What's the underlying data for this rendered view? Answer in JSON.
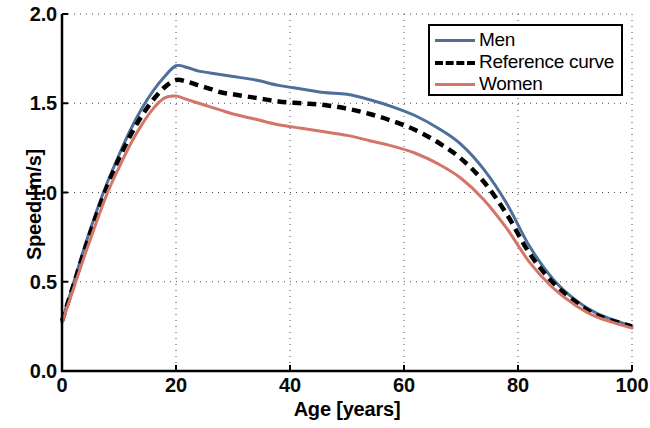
{
  "chart_data": {
    "type": "line",
    "title": "",
    "xlabel": "Age [years]",
    "ylabel": "Speed [m/s]",
    "xlim": [
      0,
      100
    ],
    "ylim": [
      0,
      2.0
    ],
    "xticks": [
      "0",
      "20",
      "40",
      "60",
      "80",
      "100"
    ],
    "xtick_values": [
      0,
      20,
      40,
      60,
      80,
      100
    ],
    "yticks": [
      "0.0",
      "0.5",
      "1.0",
      "1.5",
      "2.0"
    ],
    "ytick_values": [
      0.0,
      0.5,
      1.0,
      1.5,
      2.0
    ],
    "grid": true,
    "grid_style": "dotted",
    "legend_position": "top-right",
    "x": [
      0,
      2,
      4,
      6,
      8,
      10,
      12,
      14,
      16,
      18,
      20,
      22,
      24,
      26,
      28,
      30,
      34,
      38,
      42,
      46,
      50,
      54,
      58,
      62,
      66,
      70,
      74,
      78,
      82,
      86,
      90,
      94,
      100
    ],
    "series": [
      {
        "name": "Men",
        "color": "#4d6f9a",
        "style": "solid",
        "values": [
          0.28,
          0.49,
          0.7,
          0.89,
          1.06,
          1.21,
          1.35,
          1.47,
          1.57,
          1.65,
          1.71,
          1.7,
          1.68,
          1.67,
          1.66,
          1.65,
          1.63,
          1.6,
          1.58,
          1.56,
          1.55,
          1.52,
          1.48,
          1.43,
          1.36,
          1.27,
          1.13,
          0.94,
          0.7,
          0.52,
          0.4,
          0.32,
          0.25
        ]
      },
      {
        "name": "Reference curve",
        "color": "#000000",
        "style": "dashed",
        "values": [
          0.28,
          0.48,
          0.68,
          0.87,
          1.04,
          1.19,
          1.32,
          1.43,
          1.52,
          1.59,
          1.63,
          1.62,
          1.6,
          1.58,
          1.56,
          1.55,
          1.53,
          1.51,
          1.5,
          1.49,
          1.47,
          1.44,
          1.4,
          1.35,
          1.28,
          1.19,
          1.06,
          0.88,
          0.66,
          0.5,
          0.39,
          0.31,
          0.25
        ]
      },
      {
        "name": "Women",
        "color": "#d4756a",
        "style": "solid",
        "values": [
          0.27,
          0.46,
          0.65,
          0.83,
          1.0,
          1.14,
          1.27,
          1.38,
          1.47,
          1.53,
          1.54,
          1.52,
          1.5,
          1.48,
          1.46,
          1.44,
          1.41,
          1.38,
          1.36,
          1.34,
          1.32,
          1.29,
          1.26,
          1.22,
          1.16,
          1.08,
          0.96,
          0.8,
          0.61,
          0.47,
          0.37,
          0.3,
          0.24
        ]
      }
    ]
  },
  "axes": {
    "xlabel": "Age [years]",
    "ylabel": "Speed [m/s]"
  },
  "legend": {
    "items": [
      {
        "label": "Men",
        "style": "ls-solid-blue",
        "icon": "line-solid-blue-icon"
      },
      {
        "label": "Reference curve",
        "style": "ls-dashed",
        "icon": "line-dashed-black-icon"
      },
      {
        "label": "Women",
        "style": "ls-solid-red",
        "icon": "line-solid-red-icon"
      }
    ]
  }
}
